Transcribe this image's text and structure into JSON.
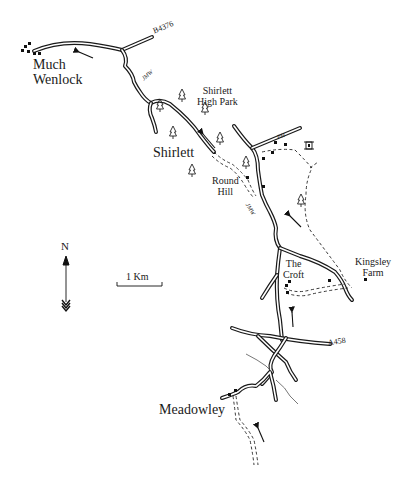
{
  "map": {
    "places": {
      "much_wenlock": [
        "Much",
        "Wenlock"
      ],
      "shirlett": "Shirlett",
      "shirlett_high_park": [
        "Shirlett",
        "High Park"
      ],
      "round_hill": [
        "Round",
        "Hill"
      ],
      "the_croft": [
        "The",
        "Croft"
      ],
      "kingsley_farm": [
        "Kingsley",
        "Farm"
      ],
      "meadowley": "Meadowley"
    },
    "roads": {
      "b4376": "B4376",
      "a458": "A458",
      "jmw_north": "JMW",
      "jmw_south": "JMW"
    },
    "poi": {
      "pub": "PH"
    },
    "compass": {
      "label": "N"
    },
    "scale": {
      "label": "1 Km"
    },
    "colors": {
      "ink": "#1a1a1a",
      "background": "#ffffff"
    }
  }
}
